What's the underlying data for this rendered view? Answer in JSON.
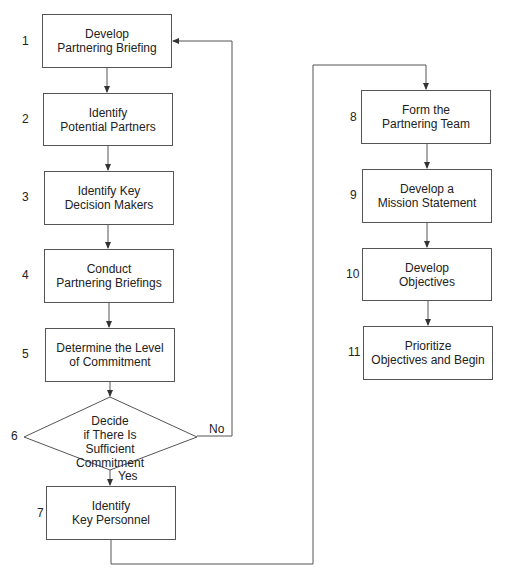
{
  "diagram": {
    "type": "flowchart",
    "steps": [
      {
        "num": "1",
        "lines": [
          "Develop",
          "Partnering Briefing"
        ]
      },
      {
        "num": "2",
        "lines": [
          "Identify",
          "Potential Partners"
        ]
      },
      {
        "num": "3",
        "lines": [
          "Identify Key",
          "Decision Makers"
        ]
      },
      {
        "num": "4",
        "lines": [
          "Conduct",
          "Partnering Briefings"
        ]
      },
      {
        "num": "5",
        "lines": [
          "Determine the Level",
          "of Commitment"
        ]
      },
      {
        "num": "6",
        "lines": [
          "Decide",
          "if There Is",
          "Sufficient Commitment"
        ],
        "shape": "decision"
      },
      {
        "num": "7",
        "lines": [
          "Identify",
          "Key Personnel"
        ]
      },
      {
        "num": "8",
        "lines": [
          "Form the",
          "Partnering Team"
        ]
      },
      {
        "num": "9",
        "lines": [
          "Develop a",
          "Mission Statement"
        ]
      },
      {
        "num": "10",
        "lines": [
          "Develop",
          "Objectives"
        ]
      },
      {
        "num": "11",
        "lines": [
          "Prioritize",
          "Objectives and Begin"
        ]
      }
    ],
    "edge_labels": {
      "no": "No",
      "yes": "Yes"
    },
    "colors": {
      "stroke": "#555555",
      "text": "#222222",
      "background": "#ffffff"
    }
  }
}
